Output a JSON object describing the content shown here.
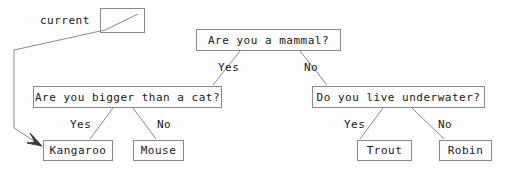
{
  "diagram": {
    "type": "decision-tree",
    "title_text": "",
    "stroke_color": "#8a8a8a",
    "text_color": "#1a1a1a",
    "background_color": "#fdfdfd",
    "pointer": {
      "label": "current",
      "box_value": "",
      "points_to": "Kangaroo"
    },
    "nodes": {
      "root": {
        "text": "Are you a mammal?",
        "kind": "question"
      },
      "left_question": {
        "text": "Are you bigger than a cat?",
        "kind": "question"
      },
      "right_question": {
        "text": "Do you live underwater?",
        "kind": "question"
      },
      "leaf_kangaroo": {
        "text": "Kangaroo",
        "kind": "leaf"
      },
      "leaf_mouse": {
        "text": "Mouse",
        "kind": "leaf"
      },
      "leaf_trout": {
        "text": "Trout",
        "kind": "leaf"
      },
      "leaf_robin": {
        "text": "Robin",
        "kind": "leaf"
      }
    },
    "edge_labels": {
      "root_yes": "Yes",
      "root_no": "No",
      "left_yes": "Yes",
      "left_no": "No",
      "right_yes": "Yes",
      "right_no": "No"
    }
  }
}
